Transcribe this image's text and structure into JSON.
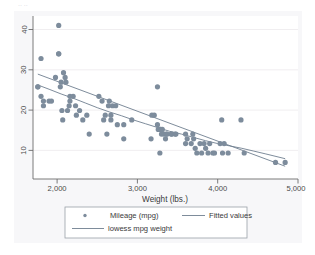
{
  "figure": {
    "background_color": "#ffffff",
    "plot_background_color": "#ffffff",
    "outer_band_color": "#f4f4f6",
    "top_fragment": "·· ··"
  },
  "chart_data": {
    "type": "scatter",
    "title": "",
    "subtitle": "",
    "xlabel": "Weight (lbs.)",
    "ylabel": "",
    "xlim": [
      1700,
      5000
    ],
    "ylim": [
      8.5,
      43
    ],
    "xticks": [
      2000,
      3000,
      4000,
      5000
    ],
    "xticklabels": [
      "2,000",
      "3,000",
      "4,000",
      "5,000"
    ],
    "yticks": [
      10,
      20,
      30,
      40
    ],
    "yticklabels": [
      "10",
      "20",
      "30",
      "40"
    ],
    "ytick_label_rotation": 90,
    "grid": true,
    "grid_axis": "y",
    "grid_color": "#eceaec",
    "marker_color": "#7d8c9c",
    "marker_symbol": "circle",
    "marker_size": 2.6,
    "fit_line_color": "#6f7f90",
    "lowess_line_color": "#6f7f90",
    "legend_position": "below",
    "series": [
      {
        "name": "Mileage (mpg)",
        "type": "scatter",
        "points": [
          [
            1760,
            28
          ],
          [
            1760,
            28
          ],
          [
            1800,
            34
          ],
          [
            1800,
            26
          ],
          [
            1830,
            25
          ],
          [
            1830,
            24
          ],
          [
            1900,
            25
          ],
          [
            1930,
            25
          ],
          [
            1980,
            30
          ],
          [
            2020,
            41
          ],
          [
            2020,
            35
          ],
          [
            2020,
            35
          ],
          [
            2040,
            28
          ],
          [
            2050,
            29
          ],
          [
            2060,
            23
          ],
          [
            2070,
            21
          ],
          [
            2080,
            31
          ],
          [
            2100,
            30
          ],
          [
            2110,
            29
          ],
          [
            2130,
            23
          ],
          [
            2150,
            24
          ],
          [
            2160,
            26
          ],
          [
            2160,
            25
          ],
          [
            2200,
            26
          ],
          [
            2230,
            24
          ],
          [
            2240,
            22
          ],
          [
            2280,
            23
          ],
          [
            2320,
            21
          ],
          [
            2370,
            22
          ],
          [
            2400,
            18
          ],
          [
            2520,
            26
          ],
          [
            2560,
            25
          ],
          [
            2580,
            21
          ],
          [
            2600,
            22
          ],
          [
            2620,
            18
          ],
          [
            2640,
            24
          ],
          [
            2650,
            25
          ],
          [
            2670,
            21
          ],
          [
            2670,
            22
          ],
          [
            2690,
            24
          ],
          [
            2730,
            24
          ],
          [
            2750,
            20
          ],
          [
            2830,
            17
          ],
          [
            2830,
            20
          ],
          [
            2930,
            21
          ],
          [
            3170,
            17
          ],
          [
            3180,
            22
          ],
          [
            3210,
            22
          ],
          [
            3250,
            28
          ],
          [
            3250,
            20
          ],
          [
            3260,
            19
          ],
          [
            3280,
            19
          ],
          [
            3280,
            14
          ],
          [
            3290,
            19
          ],
          [
            3300,
            18
          ],
          [
            3310,
            19
          ],
          [
            3330,
            18
          ],
          [
            3350,
            17
          ],
          [
            3360,
            18
          ],
          [
            3370,
            18
          ],
          [
            3420,
            18
          ],
          [
            3430,
            18
          ],
          [
            3470,
            18
          ],
          [
            3480,
            18
          ],
          [
            3600,
            18
          ],
          [
            3600,
            16
          ],
          [
            3620,
            17
          ],
          [
            3670,
            16
          ],
          [
            3690,
            18
          ],
          [
            3700,
            17
          ],
          [
            3720,
            15
          ],
          [
            3740,
            14
          ],
          [
            3780,
            16
          ],
          [
            3800,
            14
          ],
          [
            3830,
            16
          ],
          [
            3850,
            15
          ],
          [
            3880,
            14
          ],
          [
            3900,
            16
          ],
          [
            3940,
            14
          ],
          [
            3960,
            14
          ],
          [
            4030,
            16
          ],
          [
            4050,
            21
          ],
          [
            4060,
            14
          ],
          [
            4080,
            16
          ],
          [
            4130,
            14
          ],
          [
            4290,
            21
          ],
          [
            4330,
            14
          ],
          [
            4720,
            12
          ],
          [
            4840,
            12
          ]
        ]
      },
      {
        "name": "Fitted values",
        "type": "line",
        "points": [
          [
            1760,
            30.7
          ],
          [
            4840,
            11.2
          ]
        ]
      },
      {
        "name": "lowess mpg weight",
        "type": "line",
        "points": [
          [
            1760,
            28.4
          ],
          [
            1900,
            27.5
          ],
          [
            2050,
            26.5
          ],
          [
            2200,
            25.6
          ],
          [
            2350,
            24.6
          ],
          [
            2500,
            23.6
          ],
          [
            2650,
            22.7
          ],
          [
            2800,
            21.9
          ],
          [
            2950,
            21.0
          ],
          [
            3100,
            20.2
          ],
          [
            3250,
            19.4
          ],
          [
            3400,
            18.6
          ],
          [
            3550,
            18.0
          ],
          [
            3700,
            17.3
          ],
          [
            3850,
            16.6
          ],
          [
            4000,
            16.0
          ],
          [
            4150,
            15.5
          ],
          [
            4300,
            15.0
          ],
          [
            4450,
            14.4
          ],
          [
            4600,
            13.8
          ],
          [
            4840,
            12.8
          ]
        ]
      }
    ]
  },
  "legend": {
    "entries": [
      {
        "label": "Mileage (mpg)",
        "marker": "circle",
        "color": "#7d8c9c"
      },
      {
        "label": "Fitted values",
        "marker": "line",
        "color": "#6f7f90"
      },
      {
        "label": "lowess mpg  weight",
        "marker": "line",
        "color": "#6f7f90"
      }
    ],
    "border_color": "#9aa0a8"
  }
}
